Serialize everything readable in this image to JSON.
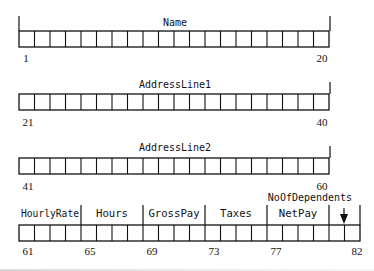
{
  "diagram": {
    "cell_width": 15.5,
    "left_x": 19,
    "rows": [
      {
        "label": "Name",
        "start": 1,
        "end": 20,
        "cells": 20,
        "box_top": 31,
        "start_label": "1",
        "end_label": "20",
        "left_tick": true,
        "right_tick": true
      },
      {
        "label": "AddressLine1",
        "start": 21,
        "end": 40,
        "cells": 20,
        "box_top": 94,
        "start_label": "21",
        "end_label": "40",
        "left_tick": false,
        "right_tick": true
      },
      {
        "label": "AddressLine2",
        "start": 41,
        "end": 60,
        "cells": 20,
        "box_top": 158,
        "start_label": "41",
        "end_label": "60",
        "left_tick": false,
        "right_tick": true
      },
      {
        "label": "",
        "start": 61,
        "end": 82,
        "cells": 22,
        "box_top": 225,
        "fields": [
          {
            "label": "HourlyRate",
            "start": 61,
            "width": 4,
            "start_label": "61"
          },
          {
            "label": "Hours",
            "start": 65,
            "width": 4,
            "start_label": "65"
          },
          {
            "label": "GrossPay",
            "start": 69,
            "width": 4,
            "start_label": "69"
          },
          {
            "label": "Taxes",
            "start": 73,
            "width": 4,
            "start_label": "73"
          },
          {
            "label": "NetPay",
            "start": 77,
            "width": 4,
            "start_label": "77"
          },
          {
            "label": "NoOfDependents",
            "start": 81,
            "width": 2,
            "start_label": ""
          }
        ],
        "end_label": "82",
        "pointer_label": "NoOfDependents"
      }
    ]
  },
  "colors": {
    "line": "#111111",
    "text": "#111111",
    "background": "#ffffff"
  }
}
